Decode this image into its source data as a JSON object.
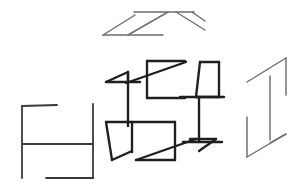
{
  "figure": {
    "background_color": "#ffffff",
    "ink_color_light": "#6e6e6e",
    "ink_color_medium": "#3a3a3a",
    "ink_color_dark": "#1f1f1f",
    "width": 305,
    "height": 189,
    "shape_count": 4
  },
  "shapes": {
    "top_z": {
      "name": "Z-with-diagonal glyph",
      "weight": "thin",
      "paths": [
        "M 103 35 L 135 15",
        "M 103 35 L 163 35",
        "M 128 35 L 168 12",
        "M 134 12 L 194 12",
        "M 176 12 L 205 30",
        "M 192 12 L 205 21"
      ]
    },
    "left_bracket": {
      "name": "bracket-frame glyph",
      "weight": "med",
      "paths": [
        "M 22 106 L 57 105",
        "M 22 106 L 22 178",
        "M 22 144 L 93 144",
        "M 93 104 L 93 178",
        "M 46 178 L 93 178"
      ]
    },
    "center_pinwheel": {
      "name": "pinwheel assembly of Z-boxes",
      "weight": "bold",
      "paths": [
        "M 106 82 L 128 72",
        "M 106 82 L 140 82",
        "M 128 72 L 128 82",
        "M 128 72 L 128 126",
        "M 147 61 L 185 61",
        "M 147 61 L 147 98",
        "M 147 98 L 185 98",
        "M 126 83 L 186 62",
        "M 200 62 L 219 62",
        "M 200 62 L 196 97",
        "M 219 62 L 219 97",
        "M 196 97 L 219 97",
        "M 199 97 L 199 142",
        "M 180 97 L 224 97",
        "M 106 122 L 175 122",
        "M 106 122 L 112 160",
        "M 112 160 L 132 151",
        "M 132 122 L 132 152",
        "M 175 122 L 175 160",
        "M 136 160 L 175 160",
        "M 136 160 L 196 139",
        "M 190 139 L 216 139",
        "M 216 139 L 199 151",
        "M 183 142 L 222 142"
      ]
    },
    "right_ibeam": {
      "name": "I-beam isometric glyph",
      "weight": "thin",
      "paths": [
        "M 247 82 L 286 58",
        "M 286 58 L 286 95",
        "M 270 76 L 270 140",
        "M 247 117 L 247 157",
        "M 247 157 L 286 134",
        "M 286 134 L 270 143"
      ]
    }
  }
}
